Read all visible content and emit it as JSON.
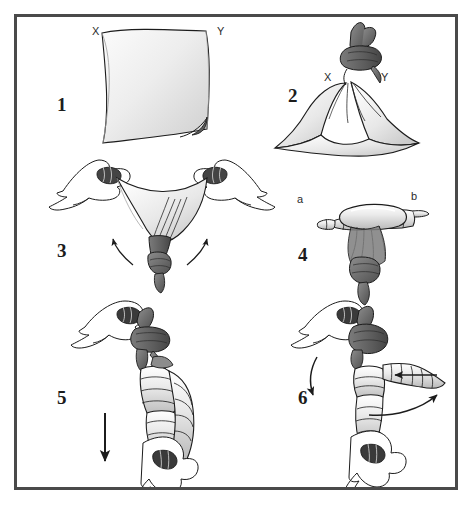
{
  "figure": {
    "frame_color": "#4a4a4a",
    "background_color": "#ffffff",
    "ink_color": "#1c1c1c"
  },
  "panels": [
    {
      "number": "1",
      "caption_labels": [
        {
          "text": "X",
          "name": "corner-label-x"
        },
        {
          "text": "Y",
          "name": "corner-label-y"
        }
      ],
      "description": "Flat square cloth held open with corners X and Y at the top"
    },
    {
      "number": "2",
      "caption_labels": [
        {
          "text": "X",
          "name": "corner-label-x"
        },
        {
          "text": "Y",
          "name": "corner-label-y"
        }
      ],
      "description": "Cloth with corners X and Y knotted together at the top"
    },
    {
      "number": "3",
      "caption_labels": [],
      "description": "Two hands grasp the cloth edges and pull outward while knotted end hangs down; curved arrows indicate upward rolling motion"
    },
    {
      "number": "4",
      "caption_labels": [
        {
          "text": "a",
          "name": "end-label-a"
        },
        {
          "text": "b",
          "name": "end-label-b"
        }
      ],
      "description": "Rolled cloth forming a horizontal roll with ends a and b, knot hanging below"
    },
    {
      "number": "5",
      "caption_labels": [],
      "description": "Upper hand holds the knot, lower hand pulls the rolled cloth downward; straight arrow indicates downward pull"
    },
    {
      "number": "6",
      "caption_labels": [],
      "description": "Upper hand holds the knot while the roll is wrapped; curved arrows indicate the wrapping rotation"
    }
  ],
  "colors": {
    "cloth_light": "#f2f2f2",
    "cloth_mid": "#d8d8d8",
    "cloth_shadow": "#9a9a9a",
    "knot_dark": "#6e6e6e",
    "knot_darker": "#4d4d4d",
    "outline": "#1c1c1c"
  }
}
